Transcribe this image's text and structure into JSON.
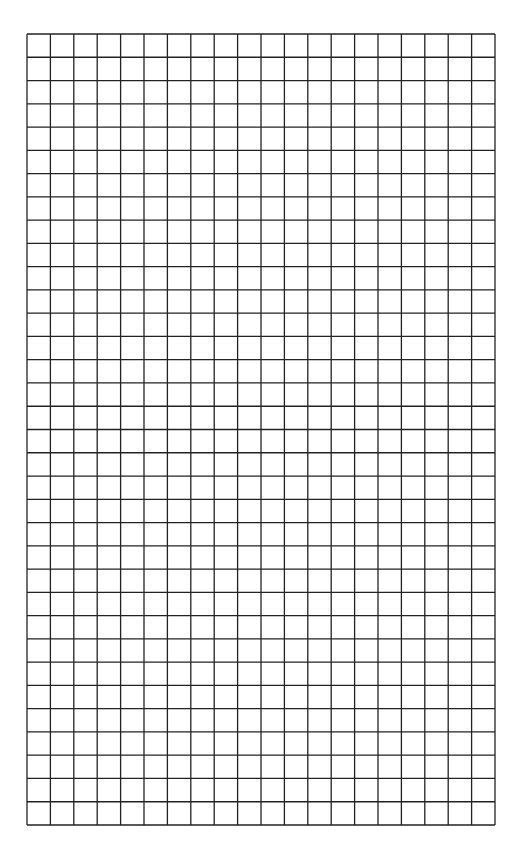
{
  "page": {
    "type": "blank graph paper",
    "background_color": "#ffffff"
  },
  "grid": {
    "columns": 20,
    "rows": 34,
    "left": 26,
    "top": 33,
    "width": 468,
    "height": 791,
    "line_color": "#222222",
    "line_width": 1.3
  }
}
